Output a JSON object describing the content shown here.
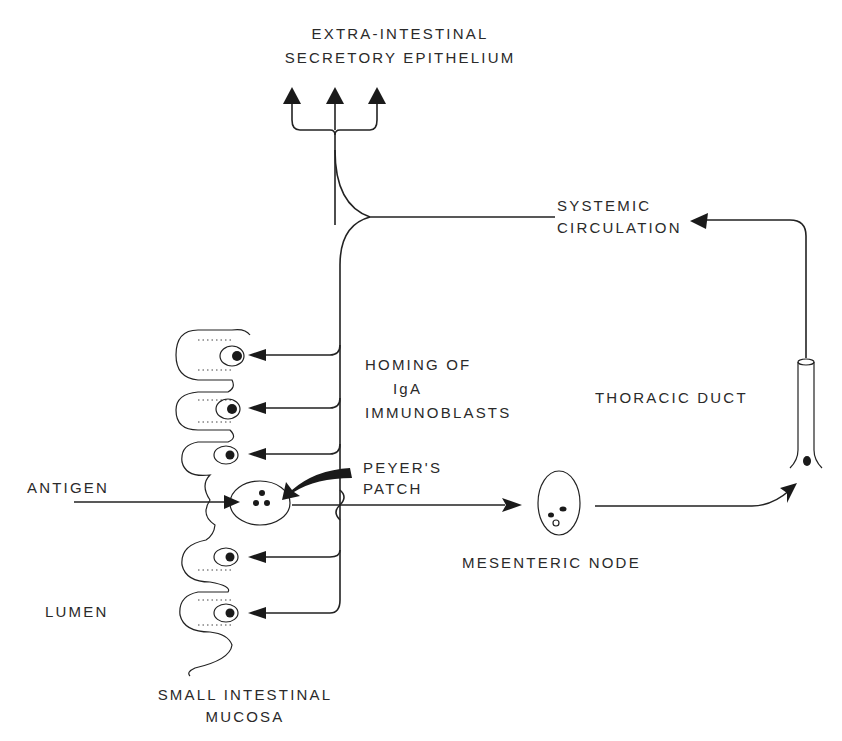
{
  "diagram": {
    "type": "flow-diagram",
    "labels": {
      "extra_intestinal": [
        "EXTRA-INTESTINAL",
        "SECRETORY  EPITHELIUM"
      ],
      "systemic": [
        "SYSTEMIC",
        "CIRCULATION"
      ],
      "homing": [
        "HOMING  OF",
        "IgA",
        "IMMUNOBLASTS"
      ],
      "thoracic_duct": "THORACIC  DUCT",
      "peyers_patch": [
        "PEYER'S",
        "PATCH"
      ],
      "antigen": "ANTIGEN",
      "mesenteric_node": "MESENTERIC  NODE",
      "lumen": "LUMEN",
      "small_intestinal_mucosa": [
        "SMALL  INTESTINAL",
        "MUCOSA"
      ]
    },
    "nodes": [
      {
        "id": "antigen",
        "label": "ANTIGEN"
      },
      {
        "id": "peyers_patch",
        "label": "PEYER'S PATCH"
      },
      {
        "id": "mesenteric_node",
        "label": "MESENTERIC NODE"
      },
      {
        "id": "thoracic_duct",
        "label": "THORACIC DUCT"
      },
      {
        "id": "systemic_circulation",
        "label": "SYSTEMIC CIRCULATION"
      },
      {
        "id": "extra_intestinal",
        "label": "EXTRA-INTESTINAL SECRETORY EPITHELIUM"
      },
      {
        "id": "mucosa",
        "label": "SMALL INTESTINAL MUCOSA"
      }
    ],
    "edges": [
      {
        "from": "antigen",
        "to": "peyers_patch"
      },
      {
        "from": "peyers_patch",
        "to": "mesenteric_node"
      },
      {
        "from": "mesenteric_node",
        "to": "thoracic_duct"
      },
      {
        "from": "thoracic_duct",
        "to": "systemic_circulation"
      },
      {
        "from": "systemic_circulation",
        "to": "extra_intestinal",
        "count": 3
      },
      {
        "from": "systemic_circulation",
        "to": "mucosa",
        "label": "HOMING OF IgA IMMUNOBLASTS",
        "count": 5
      }
    ]
  }
}
